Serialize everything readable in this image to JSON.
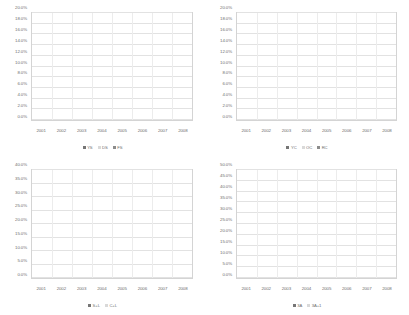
{
  "page": {
    "background": "#ffffff",
    "text_color": "#6e6e6e"
  },
  "palette": {
    "dark": "#767676",
    "light": "#d9d9d9",
    "medium": "#8c8c8c",
    "gridline": "#e2e2e2",
    "frame": "#d4d4d4"
  },
  "chart_data": [
    {
      "id": "chart-top-left",
      "type": "bar",
      "stacked": true,
      "title": "",
      "xlabel": "",
      "ylabel": "",
      "ylim": [
        0,
        20
      ],
      "ytick_labels": [
        "0.0%",
        "2.0%",
        "4.0%",
        "6.0%",
        "8.0%",
        "10.0%",
        "12.0%",
        "14.0%",
        "16.0%",
        "18.0%",
        "20.0%"
      ],
      "ytick_values": [
        0,
        2,
        4,
        6,
        8,
        10,
        12,
        14,
        16,
        18,
        20
      ],
      "grid": true,
      "legend_position": "bottom",
      "categories": [
        "2001",
        "2002",
        "2003",
        "2004",
        "2005",
        "2006",
        "2007",
        "2008"
      ],
      "series": [
        {
          "name": "YS",
          "color": "#767676",
          "values": [
            2.0,
            2.6,
            3.5,
            4.6,
            5.3,
            5.6,
            6.1,
            4.6
          ]
        },
        {
          "name": "DS",
          "color": "#d9d9d9",
          "values": [
            2.3,
            1.7,
            2.5,
            4.2,
            4.5,
            5.7,
            5.7,
            5.6
          ]
        },
        {
          "name": "FS",
          "color": "#8c8c8c",
          "values": [
            3.2,
            3.7,
            3.9,
            3.2,
            3.6,
            3.6,
            3.9,
            4.5
          ]
        }
      ]
    },
    {
      "id": "chart-top-right",
      "type": "bar",
      "stacked": true,
      "title": "",
      "xlabel": "",
      "ylabel": "",
      "ylim": [
        0,
        20
      ],
      "ytick_labels": [
        "0.0%",
        "2.0%",
        "4.0%",
        "6.0%",
        "8.0%",
        "10.0%",
        "12.0%",
        "14.0%",
        "16.0%",
        "18.0%",
        "20.0%"
      ],
      "ytick_values": [
        0,
        2,
        4,
        6,
        8,
        10,
        12,
        14,
        16,
        18,
        20
      ],
      "grid": true,
      "legend_position": "bottom",
      "categories": [
        "2001",
        "2002",
        "2003",
        "2004",
        "2005",
        "2006",
        "2007",
        "2008"
      ],
      "series": [
        {
          "name": "YC",
          "color": "#767676",
          "values": [
            1.9,
            1.5,
            2.2,
            2.5,
            2.1,
            2.3,
            2.2,
            2.4
          ]
        },
        {
          "name": "OC",
          "color": "#d9d9d9",
          "values": [
            3.8,
            3.7,
            4.8,
            3.9,
            4.5,
            4.3,
            3.8,
            3.6
          ]
        },
        {
          "name": "RC",
          "color": "#8c8c8c",
          "values": [
            7.6,
            7.7,
            7.5,
            7.1,
            6.5,
            6.8,
            6.7,
            6.6
          ]
        }
      ]
    },
    {
      "id": "chart-bottom-left",
      "type": "bar",
      "stacked": true,
      "title": "",
      "xlabel": "",
      "ylabel": "",
      "ylim": [
        0,
        40
      ],
      "ytick_labels": [
        "0.0%",
        "5.0%",
        "10.0%",
        "15.0%",
        "20.0%",
        "25.0%",
        "30.0%",
        "35.0%",
        "40.0%"
      ],
      "ytick_values": [
        0,
        5,
        10,
        15,
        20,
        25,
        30,
        35,
        40
      ],
      "grid": true,
      "legend_position": "bottom",
      "categories": [
        "2001",
        "2002",
        "2003",
        "2004",
        "2005",
        "2006",
        "2007",
        "2008"
      ],
      "series": [
        {
          "name": "S+L",
          "color": "#767676",
          "values": [
            0.3,
            0.5,
            0.6,
            0.8,
            0.7,
            0.7,
            0.6,
            0.3
          ]
        },
        {
          "name": "C+L",
          "color": "#d9d9d9",
          "values": [
            39.4,
            38.3,
            35.5,
            34.7,
            34.0,
            32.5,
            31.3,
            30.5
          ]
        }
      ]
    },
    {
      "id": "chart-bottom-right",
      "type": "bar",
      "stacked": true,
      "title": "",
      "xlabel": "",
      "ylabel": "",
      "ylim": [
        0,
        50
      ],
      "ytick_labels": [
        "0.0%",
        "5.0%",
        "10.0%",
        "15.0%",
        "20.0%",
        "25.0%",
        "30.0%",
        "35.0%",
        "40.0%",
        "45.0%",
        "50.0%"
      ],
      "ytick_values": [
        0,
        5,
        10,
        15,
        20,
        25,
        30,
        35,
        40,
        45,
        50
      ],
      "grid": true,
      "legend_position": "bottom",
      "categories": [
        "2001",
        "2002",
        "2003",
        "2004",
        "2005",
        "2006",
        "2007",
        "2008"
      ],
      "series": [
        {
          "name": "3A",
          "color": "#767676",
          "values": [
            26.3,
            26.0,
            27.1,
            27.1,
            26.8,
            26.9,
            27.1,
            29.2
          ]
        },
        {
          "name": "3A+1",
          "color": "#d9d9d9",
          "values": [
            12.6,
            13.5,
            11.8,
            10.7,
            10.4,
            10.1,
            11.0,
            10.7
          ]
        }
      ]
    }
  ]
}
